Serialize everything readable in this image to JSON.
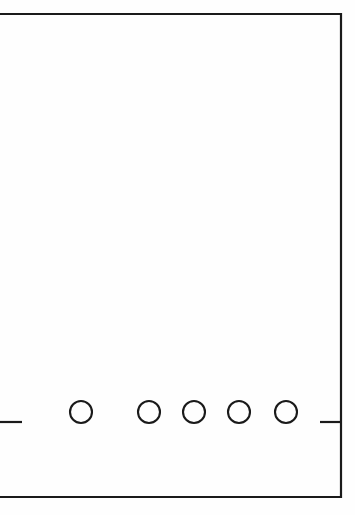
{
  "figure": {
    "background_color": "#fefefe",
    "stroke_color": "#1a1a1a",
    "canvas": {
      "width": 355,
      "height": 515
    }
  },
  "outline": {
    "name": "main-rectangle-outline",
    "top_y": 14,
    "bottom_y": 497,
    "right_x": 341,
    "left_x": 0,
    "left_edge_open": "true",
    "stroke_width": 2.2
  },
  "ticks": [
    {
      "name": "left-tick-mark",
      "x1": 0,
      "x2": 22,
      "y": 422
    },
    {
      "name": "right-tick-mark",
      "x1": 320,
      "x2": 341,
      "y": 422
    }
  ],
  "circles": [
    {
      "name": "circle-1",
      "cx": 81,
      "cy": 412,
      "r": 11
    },
    {
      "name": "circle-2",
      "cx": 149,
      "cy": 412,
      "r": 11
    },
    {
      "name": "circle-3",
      "cx": 194,
      "cy": 412,
      "r": 11
    },
    {
      "name": "circle-4",
      "cx": 239,
      "cy": 412,
      "r": 11
    },
    {
      "name": "circle-5",
      "cx": 286,
      "cy": 412,
      "r": 11
    }
  ]
}
